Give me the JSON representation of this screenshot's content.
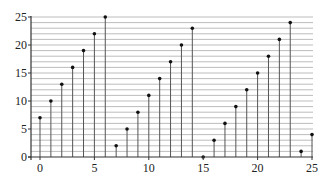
{
  "chart_data": {
    "type": "stem",
    "title": "",
    "xlabel": "",
    "ylabel": "",
    "x": [
      0,
      1,
      2,
      3,
      4,
      5,
      6,
      7,
      8,
      9,
      10,
      11,
      12,
      13,
      14,
      15,
      16,
      17,
      18,
      19,
      20,
      21,
      22,
      23,
      24,
      25
    ],
    "values": [
      7,
      10,
      13,
      16,
      19,
      22,
      25,
      2,
      5,
      8,
      11,
      14,
      17,
      20,
      23,
      0,
      3,
      6,
      9,
      12,
      15,
      18,
      21,
      24,
      1,
      4
    ],
    "xlim": [
      -1,
      25.1
    ],
    "ylim": [
      0,
      25
    ],
    "xticks": [
      0,
      5,
      10,
      15,
      20,
      25
    ],
    "yticks": [
      0,
      5,
      10,
      15,
      20,
      25
    ],
    "grid": {
      "horizontal": true,
      "horizontal_step": 1,
      "vertical": false
    },
    "legend": null,
    "colors": {
      "stem": "#555555",
      "marker": "#111111",
      "grid": "#b5b5b5",
      "axis": "#333333"
    }
  }
}
